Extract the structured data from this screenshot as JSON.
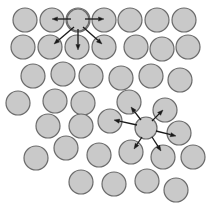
{
  "figure": {
    "width": 216,
    "height": 212,
    "background_color": "#ffffff",
    "caption": ""
  },
  "style": {
    "particle_fill": "#c9c9c9",
    "particle_stroke": "#6b6b6b",
    "particle_stroke_width": 1.2,
    "particle_radius": 12,
    "hub_radius": 11,
    "arrow_color": "#1a1a1a",
    "arrow_stroke_width": 1.3,
    "arrow_head_length": 5.5,
    "arrow_head_width": 4.2
  },
  "chart_data": {
    "type": "scatter",
    "xlabel": "",
    "ylabel": "",
    "xlim": [
      0,
      216
    ],
    "ylim": [
      0,
      212
    ],
    "grid": false,
    "legend": "none",
    "series": [
      {
        "name": "particles",
        "marker": "circle",
        "radius": 12,
        "fill": "#c9c9c9",
        "edge": "#6b6b6b",
        "points": [
          {
            "id": "p1",
            "x": 25,
            "y": 20,
            "row": 1
          },
          {
            "id": "p2",
            "x": 52,
            "y": 20,
            "row": 1
          },
          {
            "id": "p3",
            "x": 78,
            "y": 20,
            "row": 1
          },
          {
            "id": "p4",
            "x": 104,
            "y": 20,
            "row": 1
          },
          {
            "id": "p5",
            "x": 130,
            "y": 20,
            "row": 1
          },
          {
            "id": "p6",
            "x": 157,
            "y": 20,
            "row": 1
          },
          {
            "id": "p7",
            "x": 184,
            "y": 20,
            "row": 1
          },
          {
            "id": "p8",
            "x": 23,
            "y": 47,
            "row": 2
          },
          {
            "id": "p9",
            "x": 50,
            "y": 47,
            "row": 2
          },
          {
            "id": "p10",
            "x": 77,
            "y": 47,
            "row": 2
          },
          {
            "id": "p11",
            "x": 104,
            "y": 47,
            "row": 2
          },
          {
            "id": "p12",
            "x": 136,
            "y": 47,
            "row": 2
          },
          {
            "id": "p13",
            "x": 162,
            "y": 49,
            "row": 2
          },
          {
            "id": "p14",
            "x": 188,
            "y": 47,
            "row": 2
          },
          {
            "id": "p15",
            "x": 33,
            "y": 76,
            "row": 3
          },
          {
            "id": "p16",
            "x": 63,
            "y": 74,
            "row": 3
          },
          {
            "id": "p17",
            "x": 91,
            "y": 76,
            "row": 3
          },
          {
            "id": "p18",
            "x": 121,
            "y": 78,
            "row": 3
          },
          {
            "id": "p19",
            "x": 151,
            "y": 76,
            "row": 3
          },
          {
            "id": "p20",
            "x": 180,
            "y": 80,
            "row": 3
          },
          {
            "id": "p21",
            "x": 18,
            "y": 103,
            "row": 4
          },
          {
            "id": "p22",
            "x": 55,
            "y": 101,
            "row": 4
          },
          {
            "id": "p23",
            "x": 83,
            "y": 103,
            "row": 4
          },
          {
            "id": "p24",
            "x": 129,
            "y": 102,
            "row": 4
          },
          {
            "id": "p25",
            "x": 165,
            "y": 110,
            "row": 4
          },
          {
            "id": "p26",
            "x": 48,
            "y": 126,
            "row": 5
          },
          {
            "id": "p27",
            "x": 81,
            "y": 126,
            "row": 5
          },
          {
            "id": "p28",
            "x": 110,
            "y": 121,
            "row": 5
          },
          {
            "id": "p29",
            "x": 179,
            "y": 133,
            "row": 5
          },
          {
            "id": "p30",
            "x": 66,
            "y": 148,
            "row": 6
          },
          {
            "id": "p31",
            "x": 36,
            "y": 158,
            "row": 6
          },
          {
            "id": "p32",
            "x": 99,
            "y": 155,
            "row": 6
          },
          {
            "id": "p33",
            "x": 131,
            "y": 152,
            "row": 6
          },
          {
            "id": "p34",
            "x": 163,
            "y": 157,
            "row": 6
          },
          {
            "id": "p35",
            "x": 193,
            "y": 157,
            "row": 6
          },
          {
            "id": "p36",
            "x": 81,
            "y": 182,
            "row": 7
          },
          {
            "id": "p37",
            "x": 114,
            "y": 184,
            "row": 7
          },
          {
            "id": "p38",
            "x": 147,
            "y": 181,
            "row": 7
          },
          {
            "id": "p39",
            "x": 176,
            "y": 190,
            "row": 7
          }
        ]
      },
      {
        "name": "hub-particles",
        "marker": "circle",
        "radius": 11,
        "fill": "#c9c9c9",
        "edge": "#6b6b6b",
        "points": [
          {
            "id": "hub-top",
            "x": 78,
            "y": 20,
            "label": "upper interaction center",
            "arrow_count": 5
          },
          {
            "id": "hub-middle",
            "x": 146,
            "y": 128,
            "label": "lower interaction center",
            "arrow_count": 6
          }
        ]
      }
    ],
    "annotations": [
      {
        "kind": "arrow-cluster",
        "name": "upper-arrow-cluster",
        "origin_id": "hub-top",
        "origin": {
          "x": 78,
          "y": 20
        },
        "arrows": [
          {
            "id": "a1",
            "to_id": "p2",
            "x1": 71,
            "y1": 19,
            "x2": 52,
            "y2": 19,
            "angle_deg": 180
          },
          {
            "id": "a2",
            "to_id": "p4",
            "x1": 85,
            "y1": 19,
            "x2": 104,
            "y2": 19,
            "angle_deg": 0
          },
          {
            "id": "a3",
            "to_id": "p9",
            "x1": 74,
            "y1": 27,
            "x2": 54,
            "y2": 44,
            "angle_deg": 220
          },
          {
            "id": "a4",
            "to_id": "p10",
            "x1": 78,
            "y1": 29,
            "x2": 78,
            "y2": 50,
            "angle_deg": 270
          },
          {
            "id": "a5",
            "to_id": "p11",
            "x1": 83,
            "y1": 27,
            "x2": 102,
            "y2": 44,
            "angle_deg": 320
          }
        ]
      },
      {
        "kind": "arrow-cluster",
        "name": "lower-arrow-cluster",
        "origin_id": "hub-middle",
        "origin": {
          "x": 146,
          "y": 128
        },
        "arrows": [
          {
            "id": "b1",
            "to_id": "p28",
            "x1": 137,
            "y1": 125,
            "x2": 114,
            "y2": 120,
            "angle_deg": 192
          },
          {
            "id": "b2",
            "to_id": "p24",
            "x1": 141,
            "y1": 120,
            "x2": 131,
            "y2": 107,
            "angle_deg": 232
          },
          {
            "id": "b3",
            "to_id": "p25",
            "x1": 152,
            "y1": 121,
            "x2": 163,
            "y2": 110,
            "angle_deg": 314
          },
          {
            "id": "b4",
            "to_id": "p29",
            "x1": 156,
            "y1": 131,
            "x2": 176,
            "y2": 136,
            "angle_deg": 14
          },
          {
            "id": "b5",
            "to_id": "p33",
            "x1": 142,
            "y1": 137,
            "x2": 134,
            "y2": 149,
            "angle_deg": 124
          },
          {
            "id": "b6",
            "to_id": "p34",
            "x1": 152,
            "y1": 137,
            "x2": 161,
            "y2": 151,
            "angle_deg": 57
          }
        ]
      }
    ]
  }
}
